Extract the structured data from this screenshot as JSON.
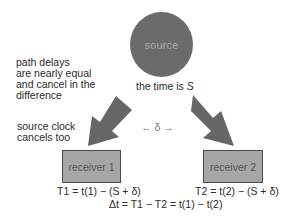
{
  "source": {
    "label": "source",
    "time_label_prefix": "the time is ",
    "time_symbol": "S"
  },
  "notes": {
    "path_delays": [
      "path delays",
      "are nearly equal",
      "and cancel in the",
      "difference"
    ],
    "source_clock": [
      "source clock",
      "cancels too"
    ]
  },
  "delta_label": "← δ →",
  "receivers": [
    {
      "label": "receiver 1",
      "equation": "T1 = t(1) − (S + δ)"
    },
    {
      "label": "receiver 2",
      "equation": "T2 = t(2) − (S + δ)"
    }
  ],
  "difference_equation": "Δt = T1 − T2 = t(1) − t(2)",
  "colors": {
    "circle": "#6b6b6b",
    "arrow": "#666666",
    "box_fill": "#a6a6a6",
    "box_border": "#4a4a4a"
  }
}
